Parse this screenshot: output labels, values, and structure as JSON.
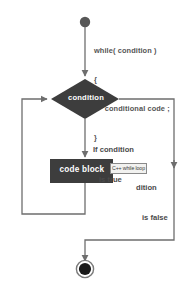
{
  "diagram": {
    "colors": {
      "shape_fill": "#3d3d3d",
      "shape_text": "#ffffff",
      "line": "#6e6e6e",
      "label_text": "#4a4a4a",
      "background": "#ffffff",
      "tooltip_bg": "#f2f2f0",
      "tooltip_border": "#8a8a8a"
    },
    "nodes": {
      "start": {
        "type": "start-node",
        "label": ""
      },
      "decision": {
        "type": "diamond",
        "label": "condition"
      },
      "process": {
        "type": "rectangle",
        "label": "code block"
      },
      "end": {
        "type": "end-node",
        "label": ""
      }
    },
    "code_snippet": {
      "line1": "while( condition )",
      "line2": "{",
      "line3": "     conditional code ;",
      "line4": "}"
    },
    "edge_labels": {
      "true_line1": "If condition",
      "true_line2": "is true",
      "false_line1": "dition",
      "false_line2": "is false"
    },
    "tooltip": {
      "text": "C++ while loop"
    }
  }
}
